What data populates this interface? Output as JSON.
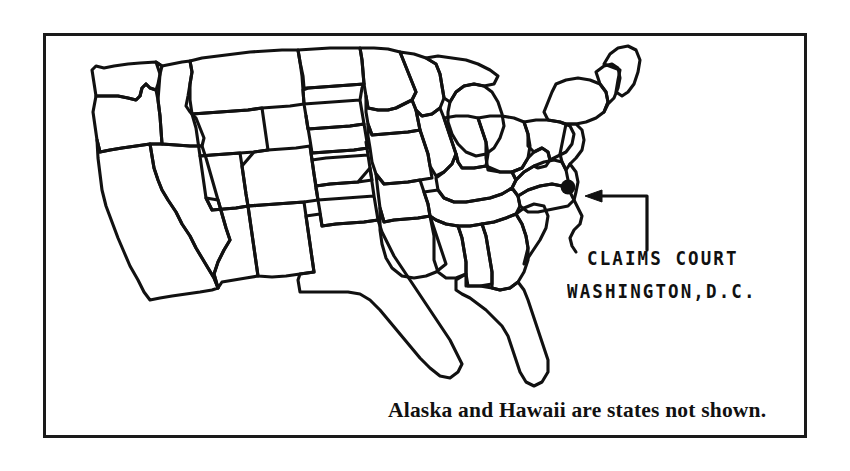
{
  "figure": {
    "type": "map",
    "frame": {
      "border_color": "#1a1a1a"
    },
    "ink_color": "#111111",
    "background_color": "#ffffff"
  },
  "annotation": {
    "line1": "CLAIMS COURT",
    "line2": "WASHINGTON,D.C.",
    "marker_label": "washington-dc-dot",
    "arrow_label": "callout-arrow"
  },
  "caption": {
    "text": "Alaska and Hawaii are states not shown."
  },
  "map_data": {
    "type": "map",
    "region": "Contiguous United States",
    "states_shown": "48 contiguous states",
    "states_not_shown": [
      "Alaska",
      "Hawaii"
    ],
    "marked_location": {
      "name": "Washington, D.C.",
      "institution": "Claims Court",
      "pixel_x": 568,
      "pixel_y": 187
    }
  }
}
